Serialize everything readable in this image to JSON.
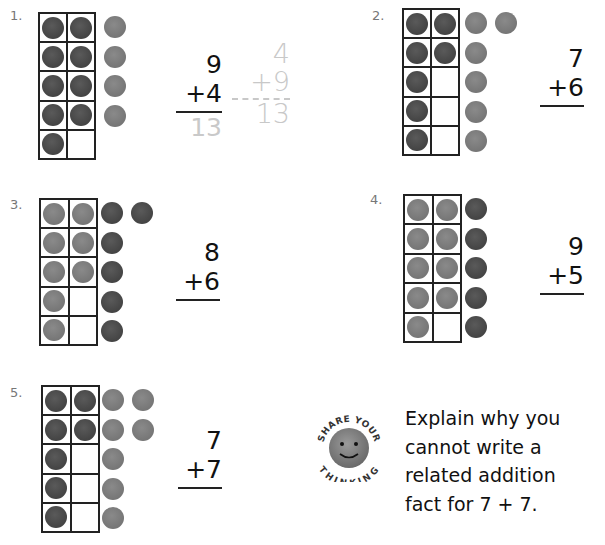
{
  "problems": [
    {
      "number": "1.",
      "addend1": "9",
      "addend2": "+4",
      "answer": "13",
      "grid": [
        "dark",
        "dark",
        "dark",
        "dark",
        "dark",
        "dark",
        "dark",
        "dark",
        "dark",
        "empty"
      ],
      "extras": [
        "light",
        "light",
        "light",
        "light"
      ],
      "related_fact": {
        "addend1": "4",
        "addend2": "+9",
        "answer": "13"
      }
    },
    {
      "number": "2.",
      "addend1": "7",
      "addend2": "+6",
      "grid": [
        "dark",
        "dark",
        "dark",
        "dark",
        "dark",
        "empty",
        "dark",
        "empty",
        "dark",
        "empty"
      ],
      "extras": [
        "light",
        "light",
        "light",
        "light",
        "light",
        "light"
      ]
    },
    {
      "number": "3.",
      "addend1": "8",
      "addend2": "+6",
      "grid": [
        "light",
        "light",
        "light",
        "light",
        "light",
        "light",
        "light",
        "empty",
        "light",
        "empty"
      ],
      "extras": [
        "dark",
        "dark",
        "dark",
        "dark",
        "dark",
        "dark"
      ]
    },
    {
      "number": "4.",
      "addend1": "9",
      "addend2": "+5",
      "grid": [
        "light",
        "light",
        "light",
        "light",
        "light",
        "light",
        "light",
        "light",
        "light",
        "empty"
      ],
      "extras": [
        "dark",
        "dark",
        "dark",
        "dark",
        "dark"
      ]
    },
    {
      "number": "5.",
      "addend1": "7",
      "addend2": "+7",
      "grid": [
        "dark",
        "dark",
        "dark",
        "dark",
        "dark",
        "empty",
        "dark",
        "empty",
        "dark",
        "empty"
      ],
      "extras": [
        "light",
        "light",
        "light",
        "light",
        "light",
        "light",
        "light"
      ]
    }
  ],
  "share_thinking": {
    "badge_top_text": "SHARE YOUR",
    "badge_bottom_text": "THINKING",
    "icon": "smiley-face-icon",
    "lines": [
      "Explain why you",
      "cannot write a",
      "related addition",
      "fact for 7 + 7."
    ]
  },
  "colors": {
    "dark_counter": "#4a4a4a",
    "light_counter": "#7a7a7a",
    "traced": "#c8c8c8"
  }
}
